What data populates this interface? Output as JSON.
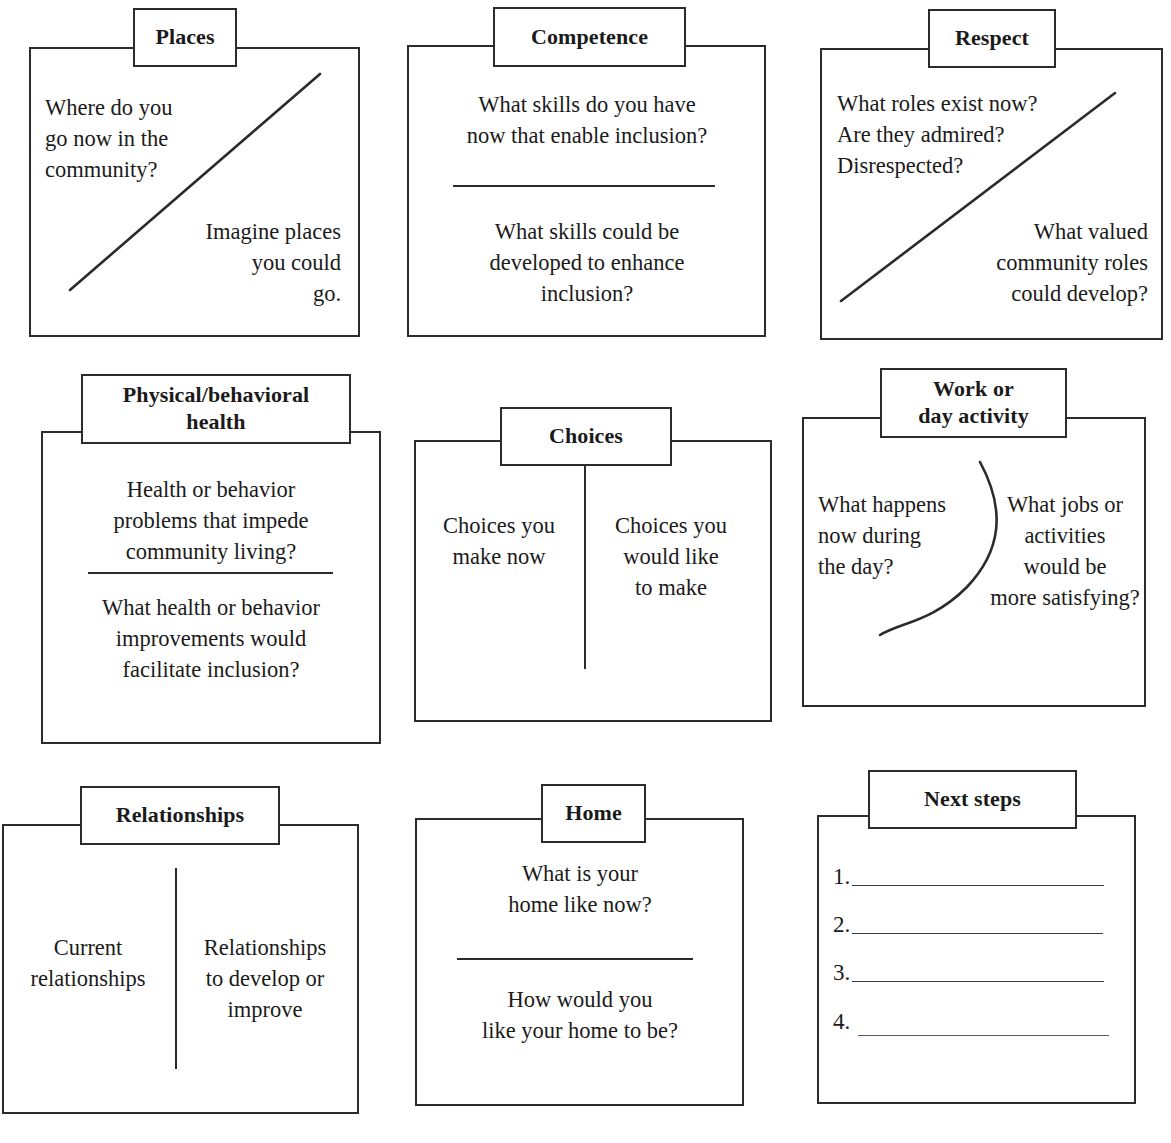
{
  "document": {
    "title": "Person-centered planning worksheet",
    "ink_color": "#2b2b2b",
    "background_color": "#ffffff"
  },
  "cards": [
    {
      "id": "places",
      "title": "Places",
      "now_text": "Where do you\ngo now in the\ncommunity?",
      "future_text": "Imagine places\nyou could\ngo.",
      "divider": "diagonal"
    },
    {
      "id": "competence",
      "title": "Competence",
      "now_text": "What skills do you have\nnow that enable inclusion?",
      "future_text": "What skills could be\ndeveloped to enhance\ninclusion?",
      "divider": "horizontal"
    },
    {
      "id": "respect",
      "title": "Respect",
      "now_text": "What roles exist now?\nAre they admired?\nDisrespected?",
      "future_text": "What valued\ncommunity roles\ncould develop?",
      "divider": "diagonal"
    },
    {
      "id": "physical-behavioral-health",
      "title": "Physical/behavioral\nhealth",
      "now_text": "Health or behavior\nproblems that impede\ncommunity living?",
      "future_text": "What health or behavior\nimprovements would\nfacilitate inclusion?",
      "divider": "horizontal"
    },
    {
      "id": "choices",
      "title": "Choices",
      "now_text": "Choices you\nmake now",
      "future_text": "Choices you\nwould like\nto make",
      "divider": "vertical"
    },
    {
      "id": "work-or-day-activity",
      "title": "Work or\nday activity",
      "now_text": "What happens\nnow during\nthe day?",
      "future_text": "What jobs or\nactivities\nwould be\nmore satisfying?",
      "divider": "curve"
    },
    {
      "id": "relationships",
      "title": "Relationships",
      "now_text": "Current\nrelationships",
      "future_text": "Relationships\nto develop or\nimprove",
      "divider": "vertical"
    },
    {
      "id": "home",
      "title": "Home",
      "now_text": "What is your\nhome like now?",
      "future_text": "How would you\nlike your home to be?",
      "divider": "horizontal"
    },
    {
      "id": "next-steps",
      "title": "Next steps",
      "divider": "none",
      "steps": [
        {
          "number": "1.",
          "value": ""
        },
        {
          "number": "2.",
          "value": ""
        },
        {
          "number": "3.",
          "value": ""
        },
        {
          "number": "4.",
          "value": ""
        }
      ]
    }
  ]
}
